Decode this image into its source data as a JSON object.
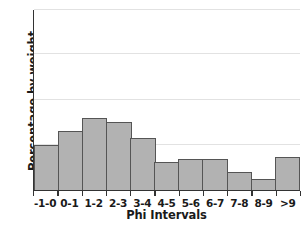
{
  "chart_data": {
    "type": "bar",
    "title": "",
    "xlabel": "Phi Intervals",
    "ylabel": "Percentage by weight",
    "categories": [
      "-1-0",
      "0-1",
      "1-2",
      "2-3",
      "3-4",
      "4-5",
      "5-6",
      "6-7",
      "7-8",
      "8-9",
      ">9"
    ],
    "values": [
      10,
      13,
      16,
      15,
      11.5,
      6.3,
      6.8,
      6.8,
      4,
      2.4,
      7.4
    ],
    "ylim": [
      0,
      40
    ],
    "yticks": [
      0,
      10,
      20,
      30,
      40
    ],
    "ytick_labels": [
      "0",
      "10",
      "20",
      "30",
      "40"
    ],
    "yminor_step": 5,
    "grid": "horizontal",
    "legend": "none",
    "bar_fill": "#b2b2b2",
    "bar_stroke": "#555555",
    "axis_color": "#333333",
    "grid_color": "#e2e2e2"
  }
}
